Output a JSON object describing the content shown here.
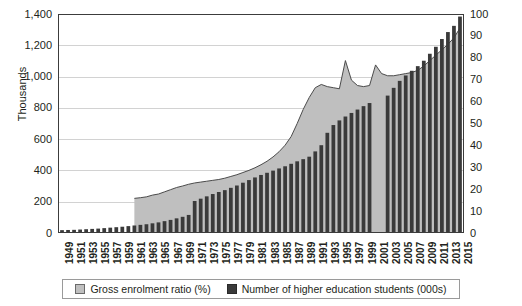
{
  "chart_data": {
    "type": "bar",
    "title": "",
    "subtitle": "",
    "xlabel": "",
    "ylabel": "Thousands",
    "y2label": "",
    "ylim": [
      0,
      1400
    ],
    "y2lim": [
      0,
      100
    ],
    "grid": true,
    "legend_position": "bottom",
    "yticks": [
      "0",
      "200",
      "400",
      "600",
      "800",
      "1,000",
      "1,200",
      "1,400"
    ],
    "ytick_values": [
      0,
      200,
      400,
      600,
      800,
      1000,
      1200,
      1400
    ],
    "y2ticks": [
      "0",
      "10",
      "20",
      "30",
      "40",
      "50",
      "60",
      "70",
      "80",
      "90",
      "100"
    ],
    "y2tick_values": [
      0,
      10,
      20,
      30,
      40,
      50,
      60,
      70,
      80,
      90,
      100
    ],
    "xtick_labels": [
      "1949",
      "1951",
      "1953",
      "1955",
      "1957",
      "1959",
      "1961",
      "1963",
      "1965",
      "1967",
      "1969",
      "1971",
      "1973",
      "1975",
      "1977",
      "1979",
      "1981",
      "1983",
      "1985",
      "1987",
      "1989",
      "1991",
      "1993",
      "1995",
      "1997",
      "1999",
      "2001",
      "2003",
      "2005",
      "2007",
      "2009",
      "2011",
      "2013",
      "2015"
    ],
    "x": [
      1949,
      1950,
      1951,
      1952,
      1953,
      1954,
      1955,
      1956,
      1957,
      1958,
      1959,
      1960,
      1961,
      1962,
      1963,
      1964,
      1965,
      1966,
      1967,
      1968,
      1969,
      1970,
      1971,
      1972,
      1973,
      1974,
      1975,
      1976,
      1977,
      1978,
      1979,
      1980,
      1981,
      1982,
      1983,
      1984,
      1985,
      1986,
      1987,
      1988,
      1989,
      1990,
      1991,
      1992,
      1993,
      1994,
      1995,
      1996,
      1997,
      1998,
      1999,
      2000,
      2001,
      2002,
      2003,
      2004,
      2005,
      2006,
      2007,
      2008,
      2009,
      2010,
      2011,
      2012,
      2013,
      2014,
      2015
    ],
    "series": [
      {
        "name": "Number of higher education students (000s)",
        "axis": "left",
        "units": "000s",
        "color": "#3a3a3a",
        "type": "bar",
        "values": [
          12,
          13,
          14,
          16,
          18,
          20,
          22,
          25,
          28,
          31,
          34,
          38,
          42,
          46,
          50,
          56,
          62,
          70,
          78,
          88,
          98,
          110,
          200,
          215,
          230,
          245,
          258,
          270,
          285,
          300,
          318,
          335,
          352,
          368,
          382,
          396,
          410,
          424,
          440,
          456,
          470,
          486,
          520,
          560,
          640,
          690,
          720,
          745,
          768,
          790,
          812,
          832,
          null,
          null,
          880,
          930,
          975,
          1010,
          1040,
          1070,
          1105,
          1150,
          1195,
          1245,
          1290,
          1330,
          1390
        ]
      },
      {
        "name": "Gross enrolment ratio (%)",
        "axis": "right",
        "units": "%",
        "color": "#bfbfbf",
        "type": "area",
        "values": [
          null,
          null,
          null,
          null,
          null,
          null,
          null,
          null,
          null,
          null,
          null,
          null,
          15.5,
          15.8,
          16.2,
          17.0,
          17.5,
          18.5,
          19.5,
          20.5,
          21.2,
          22.0,
          22.6,
          23.0,
          23.4,
          23.8,
          24.2,
          24.8,
          25.6,
          26.4,
          27.4,
          28.4,
          29.6,
          31.0,
          32.6,
          34.6,
          37.0,
          40.0,
          44.0,
          50.0,
          56.5,
          62.0,
          66.5,
          68.0,
          67.0,
          66.5,
          66.0,
          79.0,
          70.0,
          67.5,
          67.0,
          67.5,
          77.0,
          73.0,
          72.0,
          72.0,
          72.5,
          73.0,
          73.5,
          74.5,
          76.5,
          79.0,
          81.5,
          84.0,
          86.5,
          89.5,
          94.0
        ]
      }
    ]
  },
  "legend": {
    "items": [
      {
        "label": "Gross enrolment ratio (%)",
        "swatch": "area"
      },
      {
        "label": "Number of higher education students (000s)",
        "swatch": "bars"
      }
    ]
  },
  "axis_titles": {
    "y": "Thousands"
  }
}
